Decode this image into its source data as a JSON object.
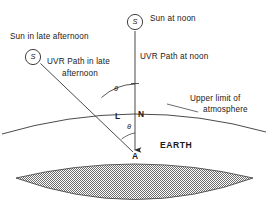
{
  "figure": {
    "background_color": "#ffffff",
    "line_color": "#2b2b2b",
    "earth_fill_color": "#8c8c8c",
    "width": 267,
    "height": 214
  },
  "labels": {
    "sun_noon": "Sun at noon",
    "sun_afternoon": "Sun in late afternoon",
    "sun_symbol": "S",
    "uvr_path_noon": "UVR Path at noon",
    "uvr_path_afternoon_line1": "UVR Path in late",
    "uvr_path_afternoon_line2": "afternoon",
    "upper_limit_line1": "Upper limit of",
    "upper_limit_line2": "atmosphere",
    "earth": "EARTH",
    "point_l": "L",
    "point_n": "N",
    "point_a": "A",
    "angle_upper": "θ",
    "angle_lower": "θ"
  },
  "geometry": {
    "sun_noon_center": [
      135,
      22
    ],
    "sun_afternoon_center": [
      33,
      57
    ],
    "sun_radius": 8,
    "point_a": [
      135,
      154
    ],
    "point_l": [
      118,
      111
    ],
    "point_n": [
      135,
      111
    ],
    "vertical_path": [
      [
        135,
        30
      ],
      [
        135,
        154
      ]
    ],
    "slanted_path": [
      [
        41,
        64
      ],
      [
        135,
        154
      ]
    ],
    "atmosphere_arc": [
      [
        2,
        133
      ],
      [
        133,
        102
      ],
      [
        265,
        131
      ]
    ],
    "earth_top_arc": [
      [
        18,
        177
      ],
      [
        135,
        155
      ],
      [
        252,
        177
      ]
    ],
    "earth_bottom_arc": [
      [
        18,
        177
      ],
      [
        135,
        214
      ],
      [
        252,
        177
      ]
    ]
  }
}
